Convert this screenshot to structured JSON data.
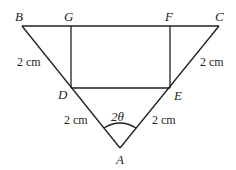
{
  "diagram": {
    "vertices": {
      "A": "A",
      "B": "B",
      "C": "C",
      "D": "D",
      "E": "E",
      "F": "F",
      "G": "G"
    },
    "measurements": {
      "BD": "2 cm",
      "CE": "2 cm",
      "AD": "2 cm",
      "AE": "2 cm"
    },
    "angle_label": "2θ"
  }
}
